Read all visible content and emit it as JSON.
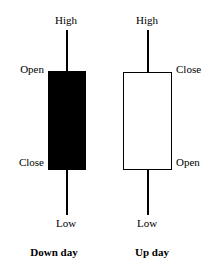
{
  "figure": {
    "background_color": "#ffffff",
    "ink_color": "#000000"
  },
  "chart_data": {
    "type": "candlestick",
    "title": "",
    "xlabel": "",
    "ylabel": "",
    "grid": false,
    "legend": "none",
    "annotation_labels": [
      "High",
      "Open",
      "Close",
      "Low"
    ],
    "candles": [
      {
        "name": "Down day",
        "direction": "down",
        "body_fill": "#000000",
        "body_border": "#000000",
        "labels": {
          "high": "High",
          "open": "Open",
          "close": "Close",
          "low": "Low"
        },
        "label_sides": {
          "high": "top-center",
          "open": "left",
          "close": "left",
          "low": "bottom-center"
        },
        "relative_levels": {
          "high": 1.0,
          "open": 0.78,
          "close": 0.25,
          "low": 0.0
        }
      },
      {
        "name": "Up day",
        "direction": "up",
        "body_fill": "#ffffff",
        "body_border": "#000000",
        "labels": {
          "high": "High",
          "close": "Close",
          "open": "Open",
          "low": "Low"
        },
        "label_sides": {
          "high": "top-center",
          "close": "right",
          "open": "right",
          "low": "bottom-center"
        },
        "relative_levels": {
          "high": 1.0,
          "close": 0.78,
          "open": 0.25,
          "low": 0.0
        }
      }
    ]
  },
  "captions": {
    "down_day": "Down day",
    "up_day": "Up day"
  }
}
